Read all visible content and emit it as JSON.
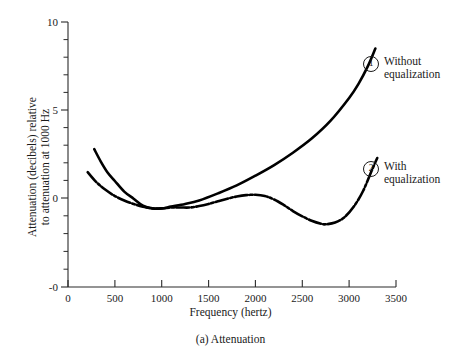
{
  "caption": "(a) Attenuation",
  "legend": [
    {
      "marker": "1",
      "label": "Without\nequalization"
    },
    {
      "marker": "2",
      "label": "With\nequalization"
    }
  ],
  "chart_data": {
    "type": "line",
    "title": "(a) Attenuation",
    "xlabel": "Frequency (hertz)",
    "ylabel_line1": "Attenuation (decibels) relative",
    "ylabel_line2": "to attenuation at 1000 Hz",
    "xlim": [
      0,
      3500
    ],
    "ylim": [
      -5,
      10
    ],
    "xticks": [
      0,
      500,
      1000,
      1500,
      2000,
      2500,
      3000,
      3500
    ],
    "xticklabels": [
      "0",
      "500",
      "1000",
      "1500",
      "2000",
      "2500",
      "3000",
      "3500"
    ],
    "yticks": [
      10,
      5,
      0,
      -5
    ],
    "yticklabels": [
      "10",
      "5",
      "0",
      "-0"
    ],
    "y_minor_ticks": [
      9,
      8,
      7,
      6,
      4,
      3,
      2,
      1,
      -1,
      -2,
      -3,
      -4
    ],
    "grid": false,
    "legend_position": "right-inside",
    "series": [
      {
        "name": "Without equalization",
        "marker": "1",
        "style": "solid",
        "x": [
          280,
          350,
          420,
          500,
          600,
          700,
          800,
          900,
          1000,
          1100,
          1250,
          1400,
          1600,
          1800,
          2000,
          2200,
          2400,
          2600,
          2800,
          3000,
          3100,
          3200,
          3280
        ],
        "y": [
          2.8,
          2.1,
          1.5,
          1.0,
          0.4,
          0.0,
          -0.4,
          -0.55,
          -0.55,
          -0.45,
          -0.3,
          -0.1,
          0.3,
          0.75,
          1.3,
          1.9,
          2.6,
          3.4,
          4.4,
          5.7,
          6.5,
          7.5,
          8.5
        ]
      },
      {
        "name": "With equalization",
        "marker": "2",
        "style": "dash-dot",
        "x": [
          210,
          300,
          400,
          500,
          600,
          700,
          800,
          900,
          1000,
          1100,
          1200,
          1300,
          1400,
          1500,
          1600,
          1700,
          1800,
          1900,
          2000,
          2100,
          2200,
          2300,
          2400,
          2500,
          2600,
          2700,
          2750,
          2850,
          2950,
          3050,
          3150,
          3250,
          3300
        ],
        "y": [
          1.5,
          0.95,
          0.5,
          0.15,
          -0.1,
          -0.3,
          -0.45,
          -0.55,
          -0.55,
          -0.5,
          -0.5,
          -0.5,
          -0.42,
          -0.3,
          -0.15,
          0.0,
          0.12,
          0.2,
          0.22,
          0.15,
          -0.05,
          -0.35,
          -0.7,
          -1.0,
          -1.25,
          -1.42,
          -1.45,
          -1.35,
          -1.05,
          -0.45,
          0.45,
          1.7,
          2.3
        ]
      }
    ]
  }
}
